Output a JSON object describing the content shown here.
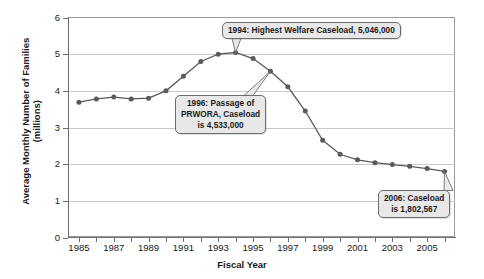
{
  "chart_data": {
    "type": "line",
    "title": "",
    "xlabel": "Fiscal Year",
    "ylabel": "Average Monthly Number of Families (millions)",
    "ylabel_line1": "Average Monthly Number of Families",
    "ylabel_line2": "(millions)",
    "ylim": [
      0,
      6
    ],
    "xlim": [
      1984.4,
      2006.6
    ],
    "grid": "horizontal",
    "legend": "none",
    "series_color": "#5a5a5a",
    "y_ticks": [
      "0",
      "1",
      "2",
      "3",
      "4",
      "5",
      "6"
    ],
    "y_tick_values": [
      0,
      1,
      2,
      3,
      4,
      5,
      6
    ],
    "x_ticks": [
      1985,
      1986,
      1987,
      1988,
      1989,
      1990,
      1991,
      1992,
      1993,
      1994,
      1995,
      1996,
      1997,
      1998,
      1999,
      2000,
      2001,
      2002,
      2003,
      2004,
      2005,
      2006
    ],
    "x_tick_labels": [
      "1985",
      "",
      "1987",
      "",
      "1989",
      "",
      "1991",
      "",
      "1993",
      "",
      "1995",
      "",
      "1997",
      "",
      "1999",
      "",
      "2001",
      "",
      "2003",
      "",
      "2005",
      ""
    ],
    "x": [
      1985,
      1986,
      1987,
      1988,
      1989,
      1990,
      1991,
      1992,
      1993,
      1994,
      1995,
      1996,
      1997,
      1998,
      1999,
      2000,
      2001,
      2002,
      2003,
      2004,
      2005,
      2006
    ],
    "values": [
      3.69,
      3.78,
      3.83,
      3.78,
      3.8,
      4.0,
      4.4,
      4.8,
      5.0,
      5.046,
      4.88,
      4.533,
      4.11,
      3.45,
      2.65,
      2.27,
      2.12,
      2.04,
      1.99,
      1.94,
      1.88,
      1.8026
    ],
    "annotations": [
      {
        "id": "1994",
        "text": "1994: Highest Welfare Caseload, 5,046,000",
        "point_year": 1994,
        "point_value": 5.046
      },
      {
        "id": "1996",
        "text_lines": [
          "1996: Passage of",
          "PRWORA, Caseload",
          "is 4,533,000"
        ],
        "point_year": 1996,
        "point_value": 4.533
      },
      {
        "id": "2006",
        "text_lines": [
          "2006: Caseload",
          "is 1,802,567"
        ],
        "point_year": 2006,
        "point_value": 1.802567
      }
    ]
  },
  "axis": {
    "y_title_line1": "Average Monthly Number of Families",
    "y_title_line2": "(millions)",
    "x_title": "Fiscal Year"
  },
  "callouts": {
    "peak": "1994: Highest Welfare Caseload, 5,046,000",
    "prwora_line1": "1996: Passage of",
    "prwora_line2": "PRWORA, Caseload",
    "prwora_line3": "is 4,533,000",
    "latest_line1": "2006: Caseload",
    "latest_line2": "is 1,802,567"
  }
}
